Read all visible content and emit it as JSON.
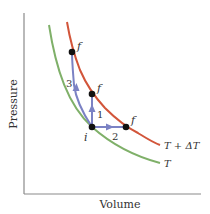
{
  "diagram": {
    "type": "PV diagram (isotherms)",
    "axes": {
      "xlabel": "Volume",
      "ylabel": "Pressure",
      "color": "#8a8a8a"
    },
    "isotherms": [
      {
        "name": "isotherm-T",
        "label": "T",
        "color": "#7fb069"
      },
      {
        "name": "isotherm-T-plus-dT",
        "label": "T + ΔT",
        "color": "#d2553a"
      }
    ],
    "points": {
      "initial": {
        "label": "i"
      },
      "finals": [
        {
          "label": "f",
          "path": "3"
        },
        {
          "label": "f",
          "path": "1"
        },
        {
          "label": "f",
          "path": "2"
        }
      ]
    },
    "paths": [
      {
        "id": "1",
        "label": "1",
        "description": "constant volume"
      },
      {
        "id": "2",
        "label": "2",
        "description": "constant pressure"
      },
      {
        "id": "3",
        "label": "3",
        "description": "adiabatic"
      }
    ],
    "path_color": "#7b82c4",
    "point_color": "#111111"
  }
}
